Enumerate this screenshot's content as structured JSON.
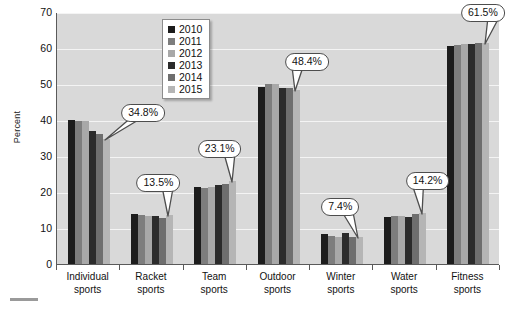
{
  "chart_data": {
    "type": "bar",
    "title": "",
    "xlabel": "",
    "ylabel": "Percent",
    "ylim": [
      0,
      70
    ],
    "ytick_step": 10,
    "yticks": [
      70,
      60,
      50,
      40,
      30,
      20,
      10,
      0
    ],
    "grid": true,
    "legend_position": "top-center",
    "categories": [
      "Individual sports",
      "Racket sports",
      "Team sports",
      "Outdoor sports",
      "Winter sports",
      "Water sports",
      "Fitness sports"
    ],
    "category_lines": [
      [
        "Individual",
        "sports"
      ],
      [
        "Racket",
        "sports"
      ],
      [
        "Team",
        "sports"
      ],
      [
        "Outdoor",
        "sports"
      ],
      [
        "Winter",
        "sports"
      ],
      [
        "Water",
        "sports"
      ],
      [
        "Fitness",
        "sports"
      ]
    ],
    "series": [
      {
        "name": "2010",
        "color": "#1c1c1c",
        "values": [
          40.0,
          13.8,
          21.5,
          49.3,
          8.2,
          13.0,
          60.6
        ]
      },
      {
        "name": "2011",
        "color": "#7d7d7d",
        "values": [
          39.8,
          13.6,
          21.2,
          49.9,
          7.9,
          13.2,
          60.7
        ]
      },
      {
        "name": "2012",
        "color": "#a8a8a8",
        "values": [
          39.6,
          13.2,
          21.3,
          49.9,
          7.6,
          13.3,
          61.0
        ]
      },
      {
        "name": "2013",
        "color": "#2b2b2b",
        "values": [
          37.0,
          13.4,
          22.0,
          49.0,
          8.5,
          13.1,
          61.2
        ]
      },
      {
        "name": "2014",
        "color": "#6e6e6e",
        "values": [
          36.0,
          12.9,
          22.3,
          48.8,
          7.6,
          13.8,
          61.3
        ]
      },
      {
        "name": "2015",
        "color": "#b5b5b5",
        "values": [
          34.8,
          13.5,
          23.1,
          48.4,
          7.4,
          14.2,
          61.5
        ]
      }
    ],
    "annotations": [
      {
        "label": "34.8%",
        "category": "Individual sports",
        "series": "2015",
        "value": 34.8
      },
      {
        "label": "13.5%",
        "category": "Racket sports",
        "series": "2015",
        "value": 13.5
      },
      {
        "label": "23.1%",
        "category": "Team sports",
        "series": "2015",
        "value": 23.1
      },
      {
        "label": "48.4%",
        "category": "Outdoor sports",
        "series": "2015",
        "value": 48.4
      },
      {
        "label": "7.4%",
        "category": "Winter sports",
        "series": "2015",
        "value": 7.4
      },
      {
        "label": "14.2%",
        "category": "Water sports",
        "series": "2015",
        "value": 14.2
      },
      {
        "label": "61.5%",
        "category": "Fitness sports",
        "series": "2015",
        "value": 61.5
      }
    ],
    "colors": {
      "plot_background": "#d9d9d9",
      "gridline": "#f4f4f4",
      "axis": "#5a5a5a",
      "text": "#111111",
      "callout_border": "#4d4d4d",
      "callout_fill": "#ffffff"
    }
  }
}
